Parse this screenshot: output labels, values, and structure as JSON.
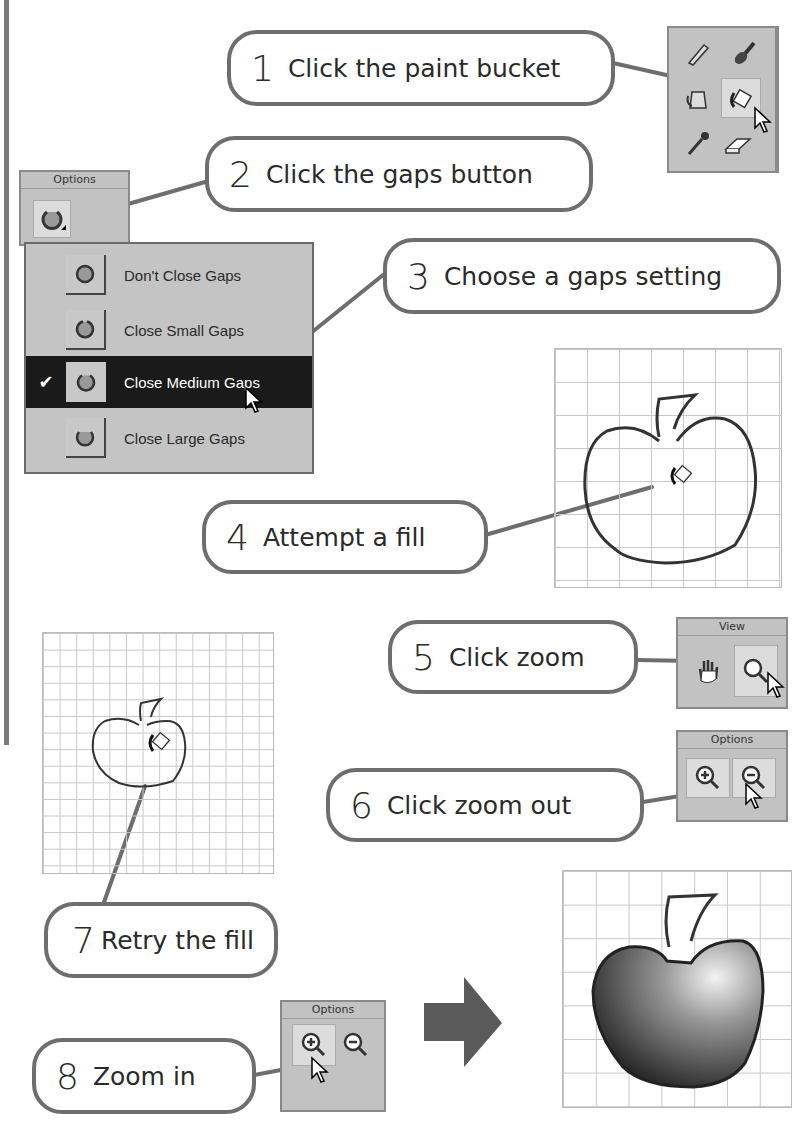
{
  "steps": [
    {
      "num": "1",
      "text": "Click the paint bucket"
    },
    {
      "num": "2",
      "text": "Click the gaps button"
    },
    {
      "num": "3",
      "text": "Choose a gaps setting"
    },
    {
      "num": "4",
      "text": "Attempt a fill"
    },
    {
      "num": "5",
      "text": "Click zoom"
    },
    {
      "num": "6",
      "text": "Click zoom out"
    },
    {
      "num": "7",
      "text": "Retry the fill"
    },
    {
      "num": "8",
      "text": "Zoom in"
    }
  ],
  "tools_panel": {
    "tools": [
      "pencil-icon",
      "brush-icon",
      "ink-bottle-icon",
      "paint-bucket-icon",
      "eyedropper-icon",
      "eraser-icon"
    ],
    "selected": "paint-bucket-icon"
  },
  "options_panel_gaps": {
    "title": "Options",
    "button_icon": "gap-size-icon"
  },
  "gaps_menu": {
    "items": [
      {
        "label": "Don't Close Gaps",
        "checked": false
      },
      {
        "label": "Close Small Gaps",
        "checked": false
      },
      {
        "label": "Close Medium Gaps",
        "checked": true
      },
      {
        "label": "Close Large Gaps",
        "checked": false
      }
    ],
    "check_mark": "✔"
  },
  "view_panel": {
    "title": "View",
    "tools": [
      "hand-icon",
      "magnifier-icon"
    ],
    "selected": "magnifier-icon"
  },
  "options_panel_zoom_out": {
    "title": "Options",
    "tools": [
      "zoom-in-icon",
      "zoom-out-icon"
    ],
    "selected": "zoom-out-icon"
  },
  "options_panel_zoom_in": {
    "title": "Options",
    "tools": [
      "zoom-in-icon",
      "zoom-out-icon"
    ],
    "selected": "zoom-in-icon"
  },
  "colors": {
    "callout_border": "#6e6e6e",
    "panel_bg": "#c2c2c2",
    "menu_highlight": "#1a1a1a",
    "grid_line": "#c8c8c8"
  }
}
